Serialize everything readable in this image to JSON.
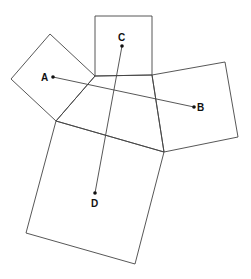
{
  "diagram": {
    "stroke_color": "#444444",
    "point_color": "#111111",
    "squares": [
      {
        "name": "top-square",
        "points": "95,16 152,16 152,75 95,76"
      },
      {
        "name": "left-square",
        "points": "50,34 11,79 56,121 95,76"
      },
      {
        "name": "right-square",
        "points": "152,75 225,62 238,137 164,152"
      },
      {
        "name": "bottom-square",
        "points": "56,121 164,152 135,264 26,233"
      }
    ],
    "quadrilateral": {
      "points": "95,76 152,75 164,152 56,121"
    },
    "segments": [
      {
        "name": "segment-AB",
        "x1": 53,
        "y1": 77,
        "x2": 194,
        "y2": 107
      },
      {
        "name": "segment-CD",
        "x1": 122,
        "y1": 46,
        "x2": 95,
        "y2": 193
      }
    ],
    "points": [
      {
        "label": "A",
        "x": 53,
        "y": 77,
        "lx": 41,
        "ly": 81
      },
      {
        "label": "B",
        "x": 194,
        "y": 107,
        "lx": 197,
        "ly": 111
      },
      {
        "label": "C",
        "x": 122,
        "y": 46,
        "lx": 118,
        "ly": 41
      },
      {
        "label": "D",
        "x": 95,
        "y": 193,
        "lx": 91,
        "ly": 207
      }
    ]
  }
}
